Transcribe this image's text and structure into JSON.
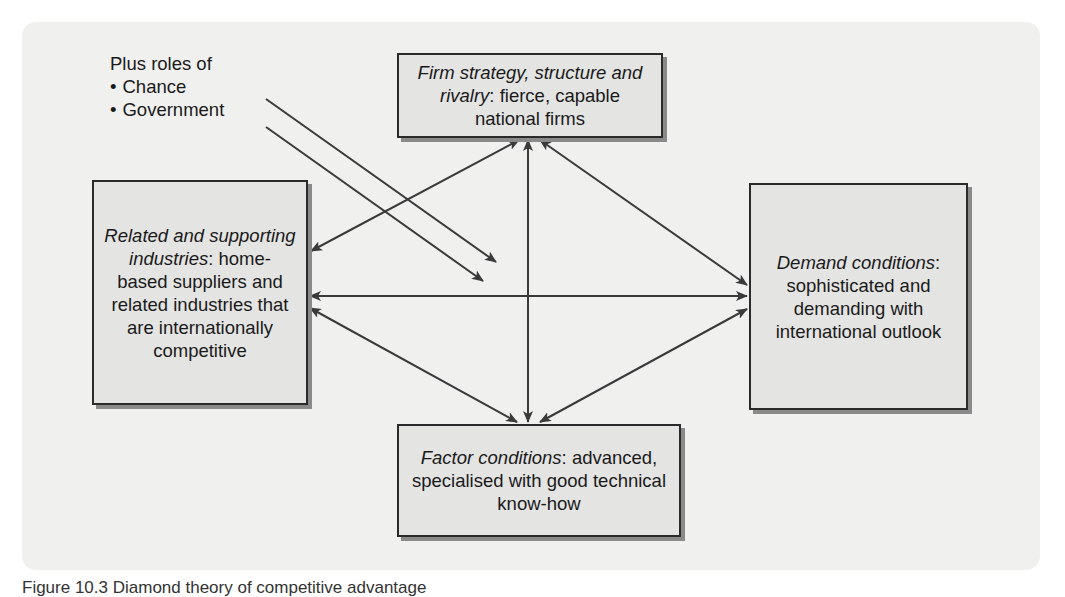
{
  "figure": {
    "caption": "Figure 10.3  Diamond theory of competitive advantage",
    "roles_note": {
      "heading": "Plus roles of",
      "items": [
        "Chance",
        "Government"
      ]
    },
    "boxes": {
      "firm": {
        "title": "Firm strategy, structure and rivalry",
        "text": ": fierce, capable national firms"
      },
      "related": {
        "title": "Related and supporting industries",
        "text": ": home-based suppliers and related industries that are internationally competitive"
      },
      "demand": {
        "title": "Demand conditions",
        "text": ": sophisticated and demanding with international outlook"
      },
      "factor": {
        "title": "Factor conditions",
        "text": ": advanced, specialised with good technical know-how"
      }
    },
    "colors": {
      "panel": "#f0f0ef",
      "box_fill": "#e4e4e3",
      "box_border": "#2a2a2a",
      "arrow": "#3a3a3a"
    }
  }
}
